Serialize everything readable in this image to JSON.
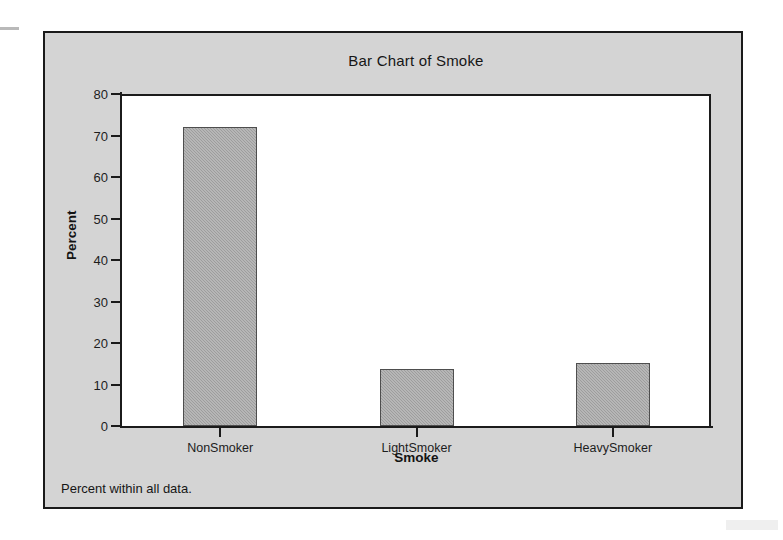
{
  "window": {
    "background_color": "#d4d4d4",
    "border_color": "#1a1a1a"
  },
  "chart_data": {
    "type": "bar",
    "title": "Bar Chart of Smoke",
    "xlabel": "Smoke",
    "ylabel": "Percent",
    "categories": [
      "NonSmoker",
      "LightSmoker",
      "HeavySmoker"
    ],
    "values": [
      72.0,
      13.7,
      15.1
    ],
    "ylim": [
      0,
      80
    ],
    "ytick_values": [
      0,
      10,
      20,
      30,
      40,
      50,
      60,
      70,
      80
    ],
    "ytick_labels": [
      "0",
      "10",
      "20",
      "30",
      "40",
      "50",
      "60",
      "70",
      "80"
    ],
    "grid": false,
    "legend": false,
    "legend_position": "none",
    "footnote": "Percent within all data.",
    "bar_fill_color": "#9d9d9d",
    "bar_edge_color": "#4e4e4e",
    "plot_background_color": "#ffffff",
    "axis_color": "#1b1b1b"
  }
}
